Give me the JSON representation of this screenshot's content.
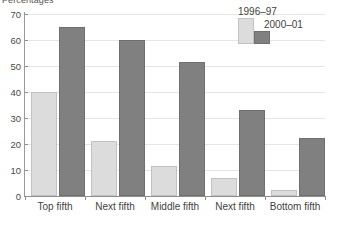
{
  "chart_data": {
    "type": "bar",
    "title": "Percentages",
    "xlabel": "",
    "ylabel": "",
    "ylim": [
      0,
      70
    ],
    "ytick_step": 10,
    "yticks": [
      0,
      10,
      20,
      30,
      40,
      50,
      60,
      70
    ],
    "grid": true,
    "legend_position": "top-right",
    "categories": [
      "Top fifth",
      "Next fifth",
      "Middle fifth",
      "Next fifth",
      "Bottom fifth"
    ],
    "series": [
      {
        "name": "1996–97",
        "color": "#dcdcdc",
        "values": [
          40,
          21,
          11.5,
          7,
          2.5
        ]
      },
      {
        "name": "2000–01",
        "color": "#808080",
        "values": [
          65,
          60,
          51.5,
          33,
          22.5
        ]
      }
    ]
  }
}
